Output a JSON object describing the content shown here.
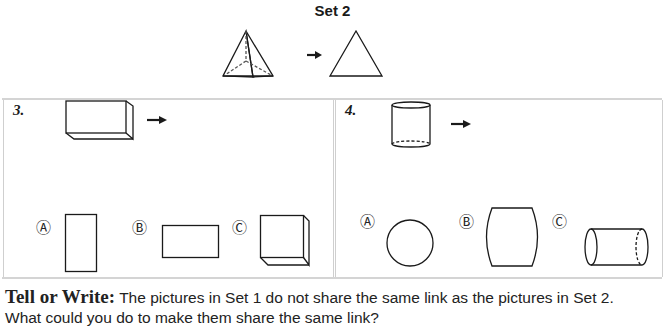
{
  "set": {
    "title": "Set 2",
    "from_shape": "triangular-pyramid",
    "to_shape": "triangle"
  },
  "problems": [
    {
      "number": "3.",
      "given_shape": "rectangular-prism",
      "options": [
        {
          "label": "Ⓐ",
          "shape": "tall-rectangle"
        },
        {
          "label": "Ⓑ",
          "shape": "wide-rectangle"
        },
        {
          "label": "Ⓒ",
          "shape": "cube"
        }
      ]
    },
    {
      "number": "4.",
      "given_shape": "cylinder",
      "options": [
        {
          "label": "Ⓐ",
          "shape": "circle"
        },
        {
          "label": "Ⓑ",
          "shape": "barrel"
        },
        {
          "label": "Ⓒ",
          "shape": "horizontal-cylinder"
        }
      ]
    }
  ],
  "footer": {
    "lead": "Tell or Write:",
    "line1": " The pictures in Set 1 do not share the same link as the pictures in Set 2.",
    "line2": "What could you do to make them share the same link?"
  },
  "colors": {
    "line": "#1a1a1a",
    "border": "#cfcfcf"
  }
}
